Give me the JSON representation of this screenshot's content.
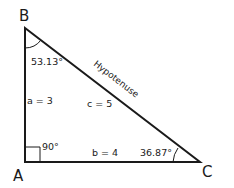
{
  "diagram": {
    "vertices": {
      "A": {
        "label": "A"
      },
      "B": {
        "label": "B"
      },
      "C": {
        "label": "C"
      }
    },
    "angles": {
      "B": "53.13°",
      "A": "90°",
      "C": "36.87°"
    },
    "sides": {
      "a": "a = 3",
      "b": "b = 4",
      "c": "c = 5",
      "hypotenuse": "Hypotenuse"
    },
    "colors": {
      "stroke": "#1a1a1a",
      "background": "#ffffff"
    }
  }
}
